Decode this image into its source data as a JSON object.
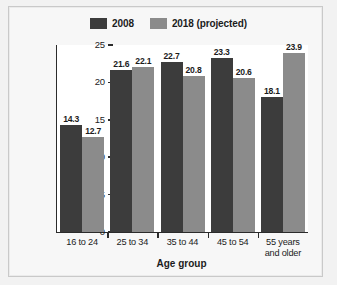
{
  "chart_data": {
    "type": "bar",
    "title": "",
    "xlabel": "Age group",
    "ylabel": "Percentage of labor force",
    "categories": [
      "16 to 24",
      "25 to 34",
      "35 to 44",
      "45 to 54",
      "55 years and older"
    ],
    "series": [
      {
        "name": "2008",
        "color": "#3c3c3c",
        "values": [
          14.3,
          21.6,
          22.7,
          23.3,
          18.1
        ]
      },
      {
        "name": "2018 (projected)",
        "color": "#8b8b8b",
        "values": [
          12.7,
          22.1,
          20.8,
          20.6,
          23.9
        ]
      }
    ],
    "ylim": [
      0,
      25
    ],
    "yticks": [
      0,
      5,
      10,
      15,
      20,
      25
    ],
    "ytick_labels": [
      "0",
      "5",
      "10",
      "15",
      "20",
      "25"
    ],
    "grid": false,
    "legend_position": "top-center",
    "value_labels": true
  },
  "legend": {
    "entries": [
      {
        "label": "2008"
      },
      {
        "label": "2018 (projected)"
      }
    ]
  }
}
